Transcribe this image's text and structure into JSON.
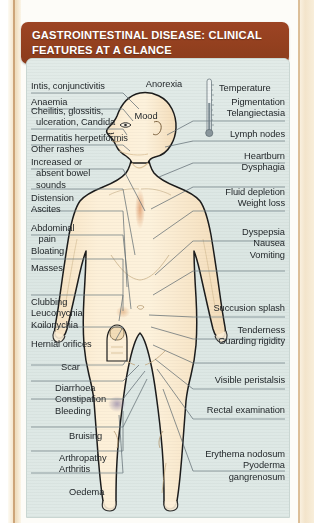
{
  "document": {
    "header_title": "GASTROINTESTINAL DISEASE: CLINICAL FEATURES AT A GLANCE",
    "colors": {
      "header_bg": "#93401f",
      "header_text": "#ffffff",
      "panel_bg": "#dde7e4",
      "skin": "#fbe9cd",
      "outline": "#1c1c1c",
      "leader_line": "#5d6a70",
      "page_edge": "#f3e4cb"
    }
  },
  "figure": {
    "thermometer_icon": "thermometer-icon"
  },
  "labels": {
    "head_top": "Anorexia",
    "head_inner": "Mood",
    "thermometer": "Temperature",
    "left": [
      {
        "id": "iritis",
        "text": "Intis, conjunctivitis"
      },
      {
        "id": "anaemia",
        "text": "Anaemia"
      },
      {
        "id": "cheilitis",
        "text": "Cheilitis, glossitis,\n  ulceration, Candida"
      },
      {
        "id": "dermatitis",
        "text": "Dermatitis herpetiformis\nOther rashes"
      },
      {
        "id": "bowel-sounds",
        "text": "Increased or\n  absent bowel\n  sounds"
      },
      {
        "id": "distension",
        "text": "Distension\nAscites"
      },
      {
        "id": "abdominal-pain",
        "text": "Abdominal\n   pain\nBloating"
      },
      {
        "id": "masses",
        "text": "Masses"
      },
      {
        "id": "clubbing",
        "text": "Clubbing\nLeuconychia\nKoilonychia"
      },
      {
        "id": "hernial-orifices",
        "text": "Hernial orifices"
      },
      {
        "id": "scar",
        "text": "Scar"
      },
      {
        "id": "diarrhoea",
        "text": "Diarrhoea\nConstipation\nBleeding"
      },
      {
        "id": "bruising",
        "text": "Bruising"
      },
      {
        "id": "arthropathy",
        "text": "Arthropathy\nArthritis"
      },
      {
        "id": "oedema",
        "text": "Oedema"
      }
    ],
    "right": [
      {
        "id": "pigmentation",
        "text": "Pigmentation\nTelangiectasia"
      },
      {
        "id": "lymph-nodes",
        "text": "Lymph nodes"
      },
      {
        "id": "heartburn",
        "text": "Heartburn\nDysphagia"
      },
      {
        "id": "fluid-depletion",
        "text": "Fluid depletion\nWeight loss"
      },
      {
        "id": "dyspepsia",
        "text": "Dyspepsia\nNausea\nVomiting"
      },
      {
        "id": "succussion-splash",
        "text": "Succusion splash"
      },
      {
        "id": "tenderness",
        "text": "Tenderness\nGuarding rigidity"
      },
      {
        "id": "visible-peristalsis",
        "text": "Visible peristalsis"
      },
      {
        "id": "rectal-examination",
        "text": "Rectal examination"
      },
      {
        "id": "erythema-nodosum",
        "text": "Erythema nodosum\nPyoderma\n   gangrenosum"
      }
    ]
  }
}
